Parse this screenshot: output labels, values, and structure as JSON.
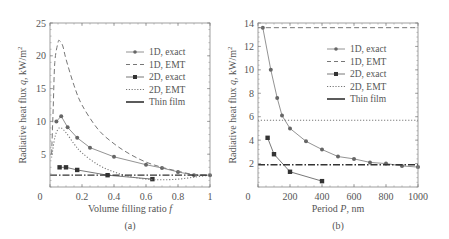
{
  "chart_data": [
    {
      "panel": "(a)",
      "type": "line",
      "xlabel": "Volume filling ratio f",
      "ylabel": "Radiative heat flux q, kW/m²",
      "xlim": [
        0,
        1
      ],
      "ylim": [
        0,
        25
      ],
      "xticks": [
        "0",
        "0.2",
        "0.4",
        "0.6",
        "0.8",
        "1"
      ],
      "yticks": [
        "5",
        "10",
        "15",
        "20",
        "25"
      ],
      "legend_position": "upper right",
      "series": [
        {
          "name": "1D, exact",
          "style": "solid-circle",
          "x": [
            0.04,
            0.07,
            0.11,
            0.17,
            0.25,
            0.4,
            0.6,
            0.7,
            0.8,
            0.9,
            1.0
          ],
          "y": [
            10.0,
            10.8,
            9.1,
            7.5,
            6.0,
            4.6,
            3.4,
            2.9,
            2.3,
            1.8,
            1.8
          ]
        },
        {
          "name": "1D, EMT",
          "style": "dashed",
          "x": [
            0.01,
            0.02,
            0.03,
            0.05,
            0.06,
            0.08,
            0.1,
            0.15,
            0.2,
            0.3,
            0.4,
            0.5,
            0.6,
            0.7,
            0.8,
            0.9,
            1.0
          ],
          "y": [
            5.0,
            12.0,
            19.0,
            22.0,
            22.3,
            21.5,
            19.5,
            15.5,
            12.5,
            8.8,
            6.6,
            5.0,
            3.8,
            3.0,
            2.4,
            1.9,
            1.8
          ]
        },
        {
          "name": "2D, exact",
          "style": "solid-square",
          "x": [
            0.06,
            0.1,
            0.17,
            0.36,
            0.64
          ],
          "y": [
            3.0,
            3.0,
            2.6,
            1.8,
            1.2
          ]
        },
        {
          "name": "2D, EMT",
          "style": "dotted",
          "x": [
            0.01,
            0.03,
            0.05,
            0.07,
            0.1,
            0.15,
            0.2,
            0.3,
            0.4,
            0.5,
            0.6,
            0.7,
            0.8,
            0.9,
            1.0
          ],
          "y": [
            4.5,
            7.5,
            8.8,
            9.0,
            8.3,
            6.6,
            5.2,
            3.4,
            2.3,
            1.6,
            1.2,
            1.1,
            1.2,
            1.5,
            1.8
          ]
        },
        {
          "name": "Thin film",
          "style": "dash-dot",
          "x": [
            0,
            1
          ],
          "y": [
            1.8,
            1.8
          ]
        }
      ],
      "panel_label": "(a)"
    },
    {
      "panel": "(b)",
      "type": "line",
      "xlabel": "Period P, nm",
      "ylabel": "Radiative heat flux q, kW/m²",
      "xlim": [
        0,
        1000
      ],
      "ylim": [
        0,
        14
      ],
      "xticks": [
        "0",
        "200",
        "400",
        "600",
        "800",
        "1000"
      ],
      "yticks": [
        "2",
        "4",
        "6",
        "8",
        "10",
        "12",
        "14"
      ],
      "legend_position": "upper right",
      "series": [
        {
          "name": "1D, exact",
          "style": "solid-circle",
          "x": [
            30,
            80,
            120,
            150,
            200,
            300,
            400,
            500,
            600,
            700,
            800,
            900,
            1000
          ],
          "y": [
            13.6,
            10.0,
            7.6,
            6.1,
            5.0,
            3.9,
            3.2,
            2.6,
            2.4,
            2.1,
            2.0,
            1.8,
            1.7
          ]
        },
        {
          "name": "1D, EMT",
          "style": "dashed",
          "x": [
            0,
            1000
          ],
          "y": [
            13.6,
            13.6
          ]
        },
        {
          "name": "2D, exact",
          "style": "solid-square",
          "x": [
            60,
            100,
            200,
            400
          ],
          "y": [
            4.2,
            2.8,
            1.3,
            0.5
          ]
        },
        {
          "name": "2D, EMT",
          "style": "dotted",
          "x": [
            0,
            1000
          ],
          "y": [
            5.7,
            5.7
          ]
        },
        {
          "name": "Thin film",
          "style": "dash-dot",
          "x": [
            0,
            1000
          ],
          "y": [
            1.9,
            1.9
          ]
        }
      ],
      "panel_label": "(b)"
    }
  ],
  "panels": {
    "a": {
      "ylabel_text": "Radiative heat flux ",
      "ylabel_var": "q",
      "ylabel_unit": ", kW/m",
      "ylabel_sup": "2",
      "xlabel_text": "Volume filling ratio ",
      "xlabel_var": "f",
      "label": "(a)",
      "xticks": [
        "0",
        "0.2",
        "0.4",
        "0.6",
        "0.8",
        "1"
      ],
      "yticks": [
        "5",
        "10",
        "15",
        "20",
        "25"
      ],
      "legend": [
        "1D, exact",
        "1D, EMT",
        "2D, exact",
        "2D, EMT",
        "Thin film"
      ]
    },
    "b": {
      "ylabel_text": "Radiative heat flux ",
      "ylabel_var": "q",
      "ylabel_unit": ", kW/m",
      "ylabel_sup": "2",
      "xlabel_text": "Period ",
      "xlabel_var": "P",
      "xlabel_unit": ", nm",
      "label": "(b)",
      "xticks": [
        "0",
        "200",
        "400",
        "600",
        "800",
        "1000"
      ],
      "yticks": [
        "2",
        "4",
        "6",
        "8",
        "10",
        "12",
        "14"
      ],
      "legend": [
        "1D, exact",
        "1D, EMT",
        "2D, exact",
        "2D, EMT",
        "Thin film"
      ]
    }
  },
  "colors": {
    "line": "#777777",
    "marker": "#666666",
    "axis": "#888888",
    "text": "#555555"
  }
}
